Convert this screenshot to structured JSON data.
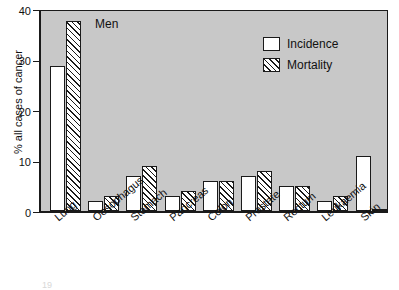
{
  "chart_data": {
    "type": "bar",
    "title": "",
    "annotation": "Men",
    "xlabel": "",
    "ylabel": "% all cases of cancer",
    "ylim": [
      0,
      40
    ],
    "yticks": [
      0,
      10,
      20,
      30,
      40
    ],
    "grid": false,
    "legend_position": "top-right",
    "categories": [
      "Lung",
      "Oesophagus",
      "Stomach",
      "Pancreas",
      "Colon",
      "Prostate",
      "Rectum",
      "Leukaemia",
      "Skin"
    ],
    "series": [
      {
        "name": "Incidence",
        "values": [
          29,
          2,
          7,
          3,
          6,
          7,
          5,
          2,
          11
        ]
      },
      {
        "name": "Mortality",
        "values": [
          38,
          3,
          9,
          4,
          6,
          8,
          5,
          3,
          0.5
        ]
      }
    ]
  },
  "legend": {
    "items": [
      {
        "label": "Incidence",
        "style": "open"
      },
      {
        "label": "Mortality",
        "style": "hatched"
      }
    ]
  },
  "axis": {
    "y_title": "% all cases of cancer",
    "y_tick_labels": [
      "0",
      "10",
      "20",
      "30",
      "40"
    ]
  },
  "annotation": {
    "text": "Men"
  },
  "artifact": {
    "text": "19"
  },
  "colors": {
    "plot_background": "#c8c8c8",
    "frame": "#1a1a1a",
    "incidence_fill": "#ffffff",
    "mortality_hatch": "#1a1a1a",
    "page_background": "#ffffff"
  }
}
